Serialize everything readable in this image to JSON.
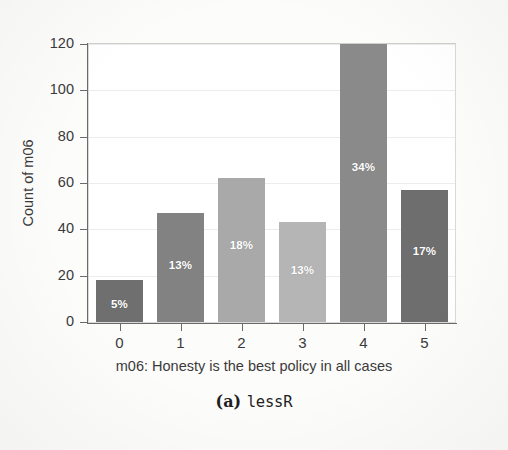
{
  "figure": {
    "caption_prefix": "(a)",
    "caption_name": "lessR"
  },
  "chart_data": {
    "type": "bar",
    "title": "",
    "xlabel": "m06: Honesty is the best policy in all cases",
    "ylabel": "Count of m06",
    "categories": [
      "0",
      "1",
      "2",
      "3",
      "4",
      "5"
    ],
    "values": [
      18,
      47,
      62,
      43,
      120,
      57
    ],
    "value_labels": [
      "5%",
      "13%",
      "18%",
      "13%",
      "34%",
      "17%"
    ],
    "ylim": [
      0,
      120
    ],
    "ytick_labels": [
      "0",
      "20",
      "40",
      "60",
      "80",
      "100",
      "120"
    ],
    "ytick_values": [
      0,
      20,
      40,
      60,
      80,
      100,
      120
    ],
    "xtick_labels": [
      "0",
      "1",
      "2",
      "3",
      "4",
      "5"
    ],
    "grid": "horizontal-light",
    "legend": "none",
    "bar_colors": [
      "#6f6f6f",
      "#828282",
      "#a9a9a9",
      "#b5b5b5",
      "#8a8a8a",
      "#6e6e6e"
    ],
    "label_color": "#ffffff",
    "axis_color": "#6a6a6a",
    "background": "#ffffff"
  }
}
